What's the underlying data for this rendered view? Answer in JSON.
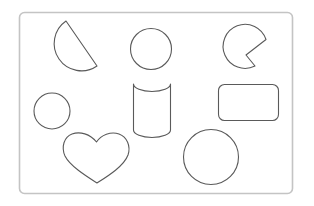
{
  "figure": {
    "stroke_color": "#5a5a5a",
    "frame_color": "#c4c4c4",
    "background": "#ffffff"
  },
  "shapes": [
    {
      "name": "semicircle",
      "position": "top-left"
    },
    {
      "name": "circle",
      "position": "top-center"
    },
    {
      "name": "pacman-sector",
      "position": "top-right"
    },
    {
      "name": "small-circle",
      "position": "middle-left"
    },
    {
      "name": "cylinder",
      "position": "middle-center"
    },
    {
      "name": "rounded-rectangle",
      "position": "middle-right"
    },
    {
      "name": "heart",
      "position": "bottom-left"
    },
    {
      "name": "large-circle",
      "position": "bottom-right"
    }
  ]
}
